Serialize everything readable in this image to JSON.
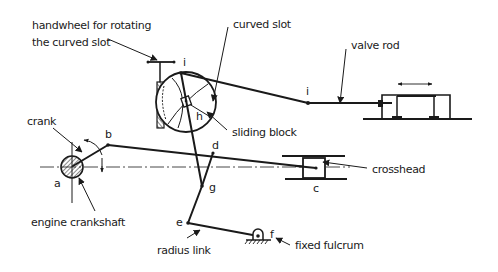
{
  "diagram": {
    "type": "mechanism-schematic",
    "colors": {
      "ink": "#1a1a1a",
      "background": "#ffffff"
    },
    "labels": {
      "handwheel_line1": "handwheel for rotating",
      "handwheel_line2": "the curved slot",
      "curved_slot": "curved slot",
      "valve_rod": "valve rod",
      "sliding_block": "sliding block",
      "crank": "crank",
      "crosshead": "crosshead",
      "engine_crankshaft": "engine crankshaft",
      "radius_link": "radius link",
      "fixed_fulcrum": "fixed fulcrum"
    },
    "points": {
      "a": "a",
      "b": "b",
      "c": "c",
      "d": "d",
      "e": "e",
      "f": "f",
      "g": "g",
      "h": "h",
      "i_top": "i",
      "i_rod": "i"
    }
  }
}
